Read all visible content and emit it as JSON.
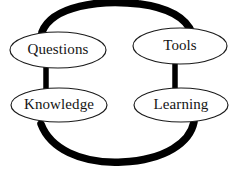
{
  "diagram": {
    "background_color": "#ffffff",
    "stroke_color": "#000000",
    "node_outline_color": "#1a1a1a",
    "text_color": "#141414",
    "nodes": [
      {
        "id": "questions",
        "label": "Questions",
        "cx": 58,
        "cy": 50,
        "rx": 48,
        "ry": 18
      },
      {
        "id": "tools",
        "label": "Tools",
        "cx": 180,
        "cy": 46,
        "rx": 47,
        "ry": 18
      },
      {
        "id": "knowledge",
        "label": "Knowledge",
        "cx": 59,
        "cy": 105,
        "rx": 48,
        "ry": 17
      },
      {
        "id": "learning",
        "label": "Learning",
        "cx": 181,
        "cy": 105,
        "rx": 47,
        "ry": 17
      }
    ],
    "links": [
      {
        "id": "questions-to-tools",
        "from": "questions",
        "to": "tools",
        "style": "thick-arc-top"
      },
      {
        "id": "tools-to-learning",
        "from": "tools",
        "to": "learning",
        "style": "thick-bar-right"
      },
      {
        "id": "learning-to-knowledge",
        "from": "learning",
        "to": "knowledge",
        "style": "thick-arc-bottom"
      },
      {
        "id": "knowledge-to-questions",
        "from": "knowledge",
        "to": "questions",
        "style": "thick-bar-left"
      }
    ]
  }
}
